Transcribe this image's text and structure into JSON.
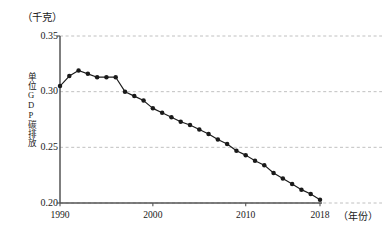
{
  "chart_data": {
    "type": "line",
    "title": "",
    "unit_caption": "（千克）",
    "ylabel": "单位GDP碳排放",
    "xlabel": "（年份）",
    "ylim": [
      0.2,
      0.35
    ],
    "xlim": [
      1990,
      2018
    ],
    "y_ticks": [
      "0.35",
      "0.30",
      "0.25",
      "0.20"
    ],
    "y_tick_values": [
      0.35,
      0.3,
      0.25,
      0.2
    ],
    "x_ticks": [
      "1990",
      "2000",
      "2010",
      "2018"
    ],
    "x_tick_values": [
      1990,
      2000,
      2010,
      2018
    ],
    "grid": "horizontal-dashed",
    "legend": "none",
    "marker": "filled-circle",
    "line_color": "#1a1a1a",
    "grid_color": "#b9b9b9",
    "axis_color": "#555555",
    "x": [
      1990,
      1991,
      1992,
      1993,
      1994,
      1995,
      1996,
      1997,
      1998,
      1999,
      2000,
      2001,
      2002,
      2003,
      2004,
      2005,
      2006,
      2007,
      2008,
      2009,
      2010,
      2011,
      2012,
      2013,
      2014,
      2015,
      2016,
      2017,
      2018
    ],
    "values": [
      0.305,
      0.314,
      0.319,
      0.316,
      0.313,
      0.313,
      0.313,
      0.3,
      0.296,
      0.292,
      0.285,
      0.281,
      0.277,
      0.273,
      0.27,
      0.266,
      0.262,
      0.257,
      0.253,
      0.247,
      0.243,
      0.238,
      0.234,
      0.227,
      0.222,
      0.217,
      0.212,
      0.208,
      0.203
    ],
    "annotations": []
  },
  "axes": {
    "unit_caption": "（千克）",
    "y_title": "单位GDP碳排放",
    "x_title": "（年份）"
  }
}
